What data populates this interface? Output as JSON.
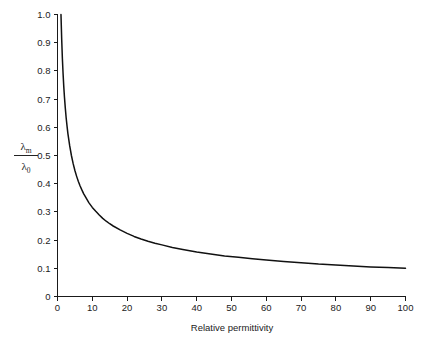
{
  "figure": {
    "background_color": "#ffffff",
    "line_color": "#111111",
    "axis_color": "#1a1a1a",
    "text_color": "#222222"
  },
  "ylabel": {
    "numerator_symbol": "λ",
    "numerator_subscript": "m",
    "denominator_symbol": "λ",
    "denominator_subscript": "0"
  },
  "chart_data": {
    "type": "line",
    "title": "",
    "xlabel": "Relative permittivity",
    "ylabel": "λm/λ0",
    "xlim": [
      0,
      100
    ],
    "ylim": [
      0,
      1.0
    ],
    "grid": false,
    "legend": false,
    "xticks": [
      0,
      10,
      20,
      30,
      40,
      50,
      60,
      70,
      80,
      90,
      100
    ],
    "xtick_labels": [
      "0",
      "10",
      "20",
      "30",
      "40",
      "50",
      "60",
      "70",
      "80",
      "90",
      "100"
    ],
    "yticks": [
      0,
      0.1,
      0.2,
      0.3,
      0.4,
      0.5,
      0.6,
      0.7,
      0.8,
      0.9,
      1.0
    ],
    "ytick_labels": [
      "0",
      "0.1",
      "0.2",
      "0.3",
      "0.4",
      "0.5",
      "0.6",
      "0.7",
      "0.8",
      "0.9",
      "1.0"
    ],
    "relation": "lambda_m / lambda_0 = 1 / sqrt(relative permittivity)",
    "series": [
      {
        "name": "λm/λ0",
        "color": "#111111",
        "x": [
          1.0,
          1.2,
          1.4,
          1.6,
          1.8,
          2.0,
          2.25,
          2.5,
          2.75,
          3.0,
          3.5,
          4.0,
          4.5,
          5.0,
          5.5,
          6.0,
          6.5,
          7.0,
          7.5,
          8.0,
          9.0,
          10.0,
          11.0,
          12.0,
          13.0,
          14.0,
          15.0,
          16.0,
          18.0,
          20.0,
          22.0,
          24.0,
          26.0,
          28.0,
          30.0,
          33.0,
          36.0,
          40.0,
          44.0,
          48.0,
          52.0,
          56.0,
          60.0,
          65.0,
          70.0,
          75.0,
          80.0,
          85.0,
          90.0,
          95.0,
          100.0
        ],
        "y": [
          1.0,
          0.913,
          0.845,
          0.791,
          0.745,
          0.707,
          0.667,
          0.632,
          0.603,
          0.577,
          0.535,
          0.5,
          0.471,
          0.447,
          0.426,
          0.408,
          0.392,
          0.378,
          0.365,
          0.354,
          0.333,
          0.316,
          0.302,
          0.289,
          0.277,
          0.267,
          0.258,
          0.25,
          0.236,
          0.224,
          0.213,
          0.204,
          0.196,
          0.189,
          0.183,
          0.174,
          0.167,
          0.158,
          0.151,
          0.144,
          0.139,
          0.134,
          0.129,
          0.124,
          0.12,
          0.115,
          0.112,
          0.108,
          0.105,
          0.103,
          0.1
        ]
      }
    ]
  }
}
